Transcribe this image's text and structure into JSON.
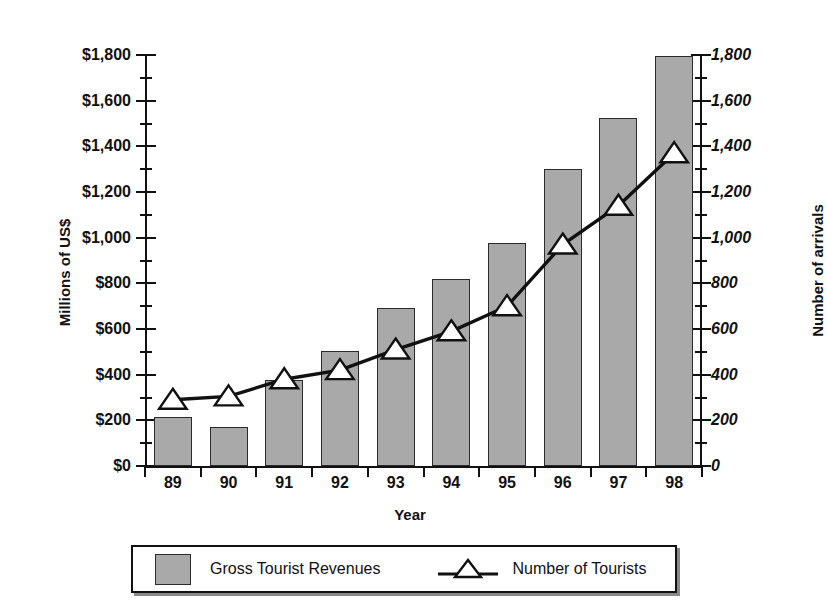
{
  "chart_data": {
    "type": "bar",
    "title": "",
    "xlabel": "Year",
    "ylabel": "Millions of US$",
    "y2label": "Number of arrivals",
    "categories": [
      "89",
      "90",
      "91",
      "92",
      "93",
      "94",
      "95",
      "96",
      "97",
      "98"
    ],
    "ylim": [
      0,
      1800
    ],
    "y2lim": [
      0,
      1800
    ],
    "ytick_step": 200,
    "yminor_step": 100,
    "grid": false,
    "legend_position": "bottom-outside",
    "series": [
      {
        "name": "Gross Tourist Revenues",
        "type": "bar",
        "axis": "left",
        "color": "#a9a9a9",
        "edge_color": "#2b2b2b",
        "values": [
          215,
          170,
          375,
          505,
          690,
          820,
          975,
          1300,
          1525,
          1795
        ]
      },
      {
        "name": "Number of Tourists",
        "type": "line",
        "axis": "right",
        "color": "#111111",
        "marker": "triangle-up",
        "marker_fill": "#ffffff",
        "values": [
          290,
          305,
          380,
          420,
          510,
          590,
          700,
          970,
          1140,
          1370
        ]
      }
    ],
    "ytick_labels_left": [
      "$1,800",
      "$1,600",
      "$1,400",
      "$1,200",
      "$1,000",
      "$800",
      "$600",
      "$400",
      "$200",
      "$0"
    ],
    "ytick_labels_right": [
      "1,800",
      "1,600",
      "1,400",
      "1,200",
      "1,000",
      "800",
      "600",
      "400",
      "200",
      "0"
    ]
  },
  "axes": {
    "left_title": "Millions of US$",
    "right_title": "Number of arrivals",
    "x_title": "Year"
  },
  "legend": {
    "bar_label": "Gross Tourist Revenues",
    "line_label": "Number of Tourists"
  }
}
